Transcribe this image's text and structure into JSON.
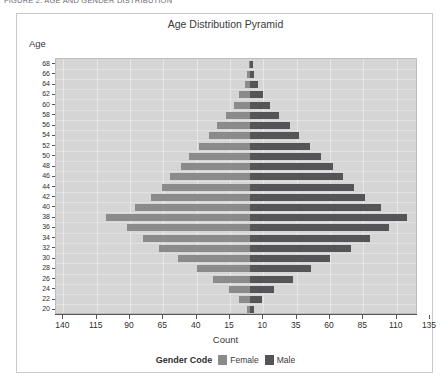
{
  "top_caption": "FIGURE 2. AGE AND GENDER DISTRIBUTION",
  "card": {
    "title": "Age Distribution Pyramid",
    "y_axis_label": "Age",
    "x_axis_label": "Count"
  },
  "legend": {
    "title": "Gender Code",
    "items": [
      {
        "label": "Female",
        "color": "#8b8b8b"
      },
      {
        "label": "Male",
        "color": "#555558"
      }
    ]
  },
  "chart_data": {
    "type": "bar",
    "title": "Age Distribution Pyramid",
    "subtitle": "",
    "xlabel": "Count",
    "ylabel": "Age",
    "orientation": "horizontal",
    "style": "population-pyramid",
    "grid": true,
    "legend_position": "bottom",
    "categories": [
      68,
      66,
      64,
      62,
      60,
      58,
      56,
      54,
      52,
      50,
      48,
      46,
      44,
      42,
      40,
      38,
      36,
      34,
      32,
      30,
      28,
      26,
      24,
      22,
      20
    ],
    "x_tick_labels_left": [
      140,
      115,
      90,
      65,
      40,
      15
    ],
    "x_tick_labels_right": [
      10,
      35,
      60,
      85,
      110,
      135
    ],
    "xlim_left": [
      0,
      148
    ],
    "xlim_right": [
      0,
      143
    ],
    "series": [
      {
        "name": "Female",
        "color": "#8b8b8b",
        "direction": "left",
        "values": [
          1,
          2,
          4,
          8,
          12,
          18,
          25,
          31,
          38,
          46,
          52,
          60,
          66,
          74,
          86,
          108,
          92,
          80,
          68,
          54,
          40,
          28,
          16,
          8,
          2
        ]
      },
      {
        "name": "Male",
        "color": "#555558",
        "direction": "right",
        "values": [
          2,
          3,
          6,
          10,
          15,
          22,
          30,
          37,
          45,
          53,
          62,
          70,
          78,
          86,
          98,
          118,
          104,
          90,
          76,
          60,
          46,
          32,
          18,
          9,
          3
        ]
      }
    ]
  }
}
